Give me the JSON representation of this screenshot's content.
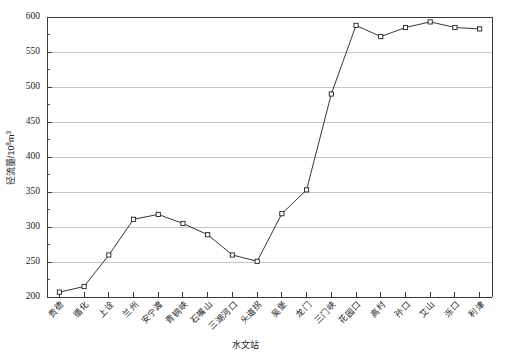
{
  "chart_data": {
    "type": "line",
    "title": "",
    "xlabel": "水文站",
    "ylabel_main": "径流量/10",
    "ylabel_sup": "8",
    "ylabel_unit": "m",
    "ylabel_unit_sup": "3",
    "ylabel_full": "径流量/10⁸m³",
    "categories": [
      "贵德",
      "循化",
      "上诠",
      "兰州",
      "安宁渡",
      "青铜峡",
      "石嘴山",
      "三湖河口",
      "头道拐",
      "吴堡",
      "龙门",
      "三门峡",
      "花园口",
      "高村",
      "孙口",
      "艾山",
      "泺口",
      "利津"
    ],
    "values": [
      207,
      215,
      260,
      311,
      318,
      305,
      289,
      260,
      251,
      319,
      353,
      490,
      588,
      572,
      585,
      593,
      585,
      583
    ],
    "ylim": [
      200,
      600
    ],
    "yticks": [
      200,
      250,
      300,
      350,
      400,
      450,
      500,
      550,
      600
    ],
    "ytick_labels": [
      "200",
      "250",
      "300",
      "350",
      "400",
      "450",
      "500",
      "550",
      "600"
    ],
    "y_minor_step": 25,
    "grid": true,
    "grid_axis": "y",
    "legend": "none",
    "marker": "open-square",
    "line_color": "#1f1f1f",
    "grid_color": "#bfbfbf",
    "axis_color": "#3a3a3a",
    "background": "#ffffff"
  }
}
